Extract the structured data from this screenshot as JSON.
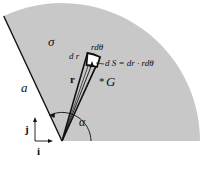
{
  "figure": {
    "labels": {
      "sigma": "σ",
      "side": "a",
      "dr": "d r",
      "rdtheta": "rdθ",
      "dS": "d S = dr · rdθ",
      "r": "r",
      "G": "G",
      "G_marker": "*",
      "alpha": "α",
      "j": "j",
      "i": "i"
    },
    "colors": {
      "sector_fill": "#c8c8c8",
      "stroke": "#111111",
      "element_fill": "#ffffff"
    },
    "geometry": {
      "apex": [
        62,
        141
      ],
      "radius": 138,
      "start_angle_deg": 0,
      "end_angle_deg": 115
    }
  }
}
